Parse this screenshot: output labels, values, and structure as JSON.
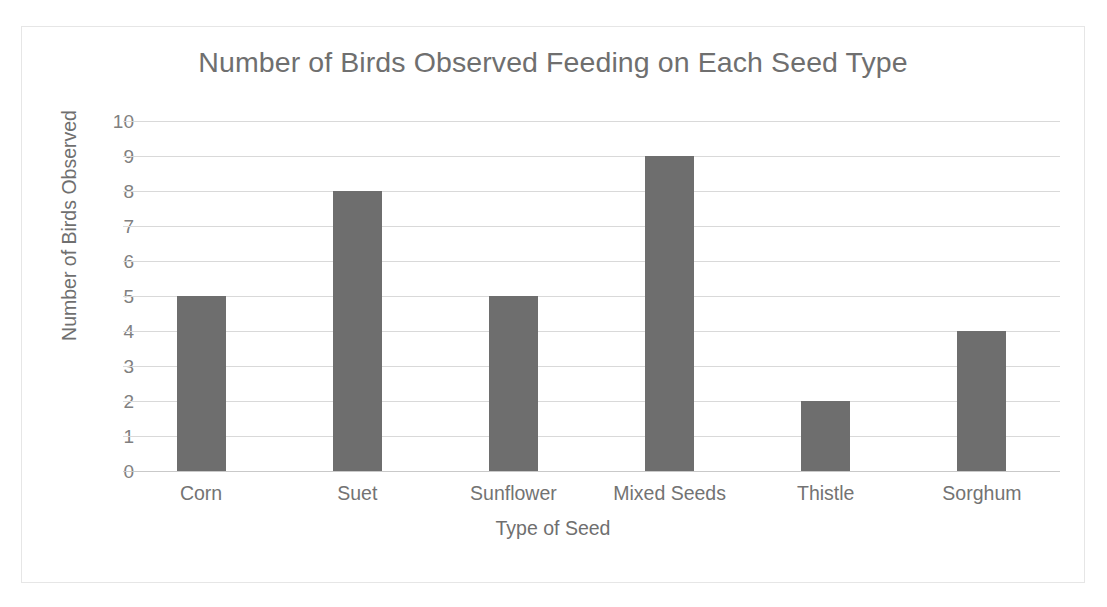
{
  "chart_data": {
    "type": "bar",
    "title": "Number of Birds Observed Feeding on Each Seed Type",
    "xlabel": "Type of Seed",
    "ylabel": "Number of Birds Observed",
    "categories": [
      "Corn",
      "Suet",
      "Sunflower",
      "Mixed Seeds",
      "Thistle",
      "Sorghum"
    ],
    "values": [
      5,
      8,
      5,
      9,
      2,
      4
    ],
    "ylim": [
      0,
      10
    ],
    "ytick_labels": [
      "10",
      "9",
      "8",
      "7",
      "6",
      "5",
      "4",
      "3",
      "2",
      "1",
      "0"
    ],
    "ytick_values": [
      10,
      9,
      8,
      7,
      6,
      5,
      4,
      3,
      2,
      1,
      0
    ],
    "grid": true,
    "legend": false,
    "bar_color": "#6e6e6e",
    "gridline_color": "#d9d9d9",
    "title_color": "#6f6f6f",
    "axis_text_color": "#737373",
    "border_color": "#e6e6e6",
    "background": "#ffffff"
  }
}
